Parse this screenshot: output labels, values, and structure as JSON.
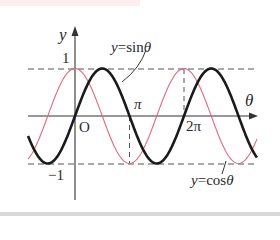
{
  "chart_data": {
    "type": "line",
    "title": "",
    "xlabel": "θ",
    "ylabel": "y",
    "origin_label": "O",
    "x_ticks": [
      {
        "value": 3.14159,
        "label": "π"
      },
      {
        "value": 6.28318,
        "label": "2π"
      }
    ],
    "y_ticks": [
      {
        "value": 1,
        "label": "1"
      },
      {
        "value": -1,
        "label": "-1"
      }
    ],
    "xlim": [
      -2.7,
      10.5
    ],
    "ylim": [
      -1,
      1
    ],
    "grid": false,
    "reference_lines": [
      "y=1 (dashed)",
      "y=-1 (dashed)",
      "θ=π (dashed)",
      "θ=2π (dashed)"
    ],
    "series": [
      {
        "name": "y=sinθ",
        "function": "sin",
        "color": "#1a1a1a",
        "style": "thick"
      },
      {
        "name": "y=cosθ",
        "function": "cos",
        "color": "#e06a78",
        "style": "thin"
      }
    ],
    "annotations": [
      {
        "text": "y=sinθ",
        "points_to": "sin curve"
      },
      {
        "text": "y=cosθ",
        "points_to": "cos curve"
      }
    ]
  },
  "labels": {
    "y_axis": "y",
    "x_axis": "θ",
    "origin": "O",
    "one": "1",
    "minus_one": "−1",
    "pi": "π",
    "two_pi": "2π",
    "sin_prefix": "y",
    "sin_rest": "=sin",
    "sin_theta": "θ",
    "cos_prefix": "y",
    "cos_rest": "=cos",
    "cos_theta": "θ"
  }
}
